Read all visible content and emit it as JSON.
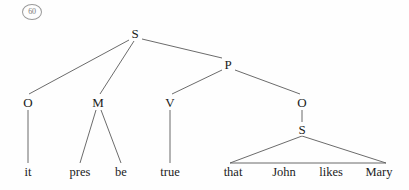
{
  "figure": {
    "example_number": "60",
    "caption": "",
    "background_color": "#fefefe",
    "line_color": "#5a5a5a",
    "text_color": "#1b1b1b"
  },
  "tree": {
    "nodes": [
      {
        "id": "S_root",
        "label": "S",
        "x": 135,
        "y": 33
      },
      {
        "id": "O_subj",
        "label": "O",
        "x": 28,
        "y": 102
      },
      {
        "id": "M",
        "label": "M",
        "x": 98,
        "y": 102
      },
      {
        "id": "P",
        "label": "P",
        "x": 228,
        "y": 64
      },
      {
        "id": "V",
        "label": "V",
        "x": 170,
        "y": 102
      },
      {
        "id": "O_obj",
        "label": "O",
        "x": 302,
        "y": 102
      },
      {
        "id": "S_embed",
        "label": "S",
        "x": 302,
        "y": 129
      }
    ],
    "terminals": [
      {
        "id": "t_it",
        "label": "it",
        "x": 28,
        "y": 172
      },
      {
        "id": "t_pres",
        "label": "pres",
        "x": 80,
        "y": 172
      },
      {
        "id": "t_be",
        "label": "be",
        "x": 121,
        "y": 172
      },
      {
        "id": "t_true",
        "label": "true",
        "x": 170,
        "y": 172
      },
      {
        "id": "t_that",
        "label": "that",
        "x": 233,
        "y": 172
      },
      {
        "id": "t_John",
        "label": "John",
        "x": 284,
        "y": 172
      },
      {
        "id": "t_likes",
        "label": "likes",
        "x": 331,
        "y": 172
      },
      {
        "id": "t_Mary",
        "label": "Mary",
        "x": 379,
        "y": 172
      }
    ],
    "edges": [
      {
        "from": "S_root",
        "to": "O_subj",
        "x1": 129,
        "y1": 40,
        "x2": 29,
        "y2": 94
      },
      {
        "from": "S_root",
        "to": "M",
        "x1": 134,
        "y1": 41,
        "x2": 100,
        "y2": 94
      },
      {
        "from": "S_root",
        "to": "P",
        "x1": 142,
        "y1": 39,
        "x2": 222,
        "y2": 58
      },
      {
        "from": "P",
        "to": "V",
        "x1": 222,
        "y1": 70,
        "x2": 172,
        "y2": 94
      },
      {
        "from": "P",
        "to": "O_obj",
        "x1": 235,
        "y1": 70,
        "x2": 300,
        "y2": 94
      },
      {
        "from": "O_subj",
        "to": "t_it",
        "x1": 28,
        "y1": 110,
        "x2": 28,
        "y2": 163
      },
      {
        "from": "M",
        "to": "t_pres",
        "x1": 96,
        "y1": 110,
        "x2": 80,
        "y2": 163
      },
      {
        "from": "M",
        "to": "t_be",
        "x1": 101,
        "y1": 110,
        "x2": 121,
        "y2": 163
      },
      {
        "from": "V",
        "to": "t_true",
        "x1": 170,
        "y1": 110,
        "x2": 170,
        "y2": 163
      },
      {
        "from": "O_obj",
        "to": "S_embed",
        "x1": 302,
        "y1": 110,
        "x2": 302,
        "y2": 122
      }
    ],
    "triangle": {
      "id": "embedded-clause-triangle",
      "apex_x": 302,
      "apex_y": 136,
      "left_x": 230,
      "left_y": 163,
      "right_x": 386,
      "right_y": 163,
      "spans": "that John likes Mary"
    }
  }
}
